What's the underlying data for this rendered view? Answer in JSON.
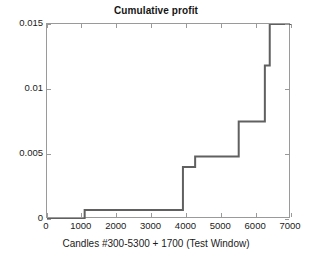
{
  "chart_data": {
    "type": "line",
    "subtype": "step",
    "title": "Cumulative profit",
    "xlabel": "Candles #300-5300 + 1700 (Test Window)",
    "ylabel": "",
    "xlim": [
      0,
      7000
    ],
    "ylim": [
      0,
      0.015
    ],
    "grid": false,
    "legend": null,
    "line_color": "#606060",
    "line_width": 2,
    "xticks": [
      0,
      1000,
      2000,
      3000,
      4000,
      5000,
      6000,
      7000
    ],
    "xtick_labels": [
      "0",
      "1000",
      "2000",
      "3000",
      "4000",
      "5000",
      "6000",
      "7000"
    ],
    "yticks": [
      0,
      0.005,
      0.01,
      0.015
    ],
    "ytick_labels": [
      "0",
      "0.005",
      "0.01",
      "0.015"
    ],
    "series": [
      {
        "name": "Cumulative profit",
        "x": [
          0,
          1080,
          1080,
          3900,
          3900,
          4250,
          4250,
          5500,
          5500,
          6250,
          6250,
          6390,
          6390,
          7000
        ],
        "y": [
          0,
          0,
          0.0007,
          0.0007,
          0.004,
          0.004,
          0.0048,
          0.0048,
          0.0075,
          0.0075,
          0.0118,
          0.0118,
          0.015,
          0.015
        ]
      }
    ],
    "steps": [
      {
        "x": 1080,
        "value": 0.0007
      },
      {
        "x": 3900,
        "value": 0.004
      },
      {
        "x": 4250,
        "value": 0.0048
      },
      {
        "x": 5500,
        "value": 0.0075
      },
      {
        "x": 6250,
        "value": 0.0118
      },
      {
        "x": 6390,
        "value": 0.015
      }
    ]
  },
  "figure": {
    "background": "#ffffff",
    "axis_color": "#9a9a9a"
  }
}
